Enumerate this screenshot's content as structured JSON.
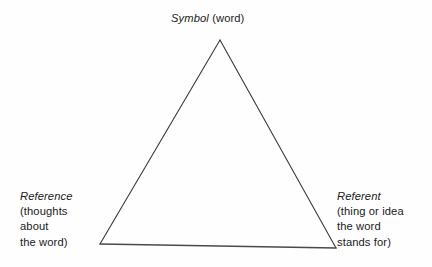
{
  "diagram": {
    "type": "semiotic-triangle",
    "title_visible": false,
    "background_color": "#fefefe",
    "line_color": "#3a3a3a",
    "text_color": "#1b1b1b",
    "vertices": {
      "apex": {
        "x": 220,
        "y": 40
      },
      "bottom_left": {
        "x": 100,
        "y": 244
      },
      "bottom_right": {
        "x": 336,
        "y": 248
      }
    },
    "nodes": {
      "symbol": {
        "term": "Symbol",
        "gloss": "(word)",
        "lines": [
          "Symbol (word)"
        ],
        "position": "top"
      },
      "reference": {
        "term": "Reference",
        "lines": [
          "(thoughts",
          "about",
          "the word)"
        ],
        "position": "bottom-left"
      },
      "referent": {
        "term": "Referent",
        "lines": [
          "(thing or idea",
          "the word",
          "stands for)"
        ],
        "position": "bottom-right"
      }
    }
  }
}
